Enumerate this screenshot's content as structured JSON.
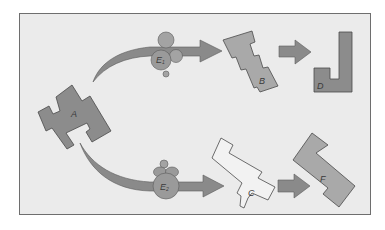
{
  "diagram": {
    "title": "",
    "colors": {
      "background": "#ffffff",
      "panel_fill": "#ebebeb",
      "panel_border": "#6e6e6e",
      "shape_dark": "#8c8c8c",
      "shape_medium": "#a9a9a9",
      "shape_light": "#f2f2f2",
      "arrow_fill": "#8a8a8a",
      "enzyme_fill": "#9a9a9a",
      "outline": "#4a4a4a",
      "label_color": "#3a3a3a"
    },
    "nodes": {
      "A": {
        "label": "A",
        "shade": "dark"
      },
      "B": {
        "label": "B",
        "shade": "medium"
      },
      "C": {
        "label": "C",
        "shade": "light"
      },
      "D": {
        "label": "D",
        "shade": "dark"
      },
      "F": {
        "label": "F",
        "shade": "medium"
      }
    },
    "enzymes": {
      "E1": {
        "letter": "E",
        "subscript": "1"
      },
      "E2": {
        "letter": "E",
        "subscript": "2"
      }
    },
    "edges": [
      {
        "from": "A",
        "to": "B",
        "via": "E1",
        "style": "curved-arrow"
      },
      {
        "from": "B",
        "to": "D",
        "style": "straight-arrow"
      },
      {
        "from": "A",
        "to": "C",
        "via": "E2",
        "style": "curved-arrow"
      },
      {
        "from": "C",
        "to": "F",
        "style": "straight-arrow"
      }
    ]
  }
}
